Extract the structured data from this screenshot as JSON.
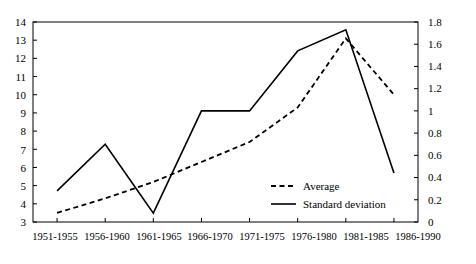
{
  "chart_data": {
    "type": "line",
    "title": "",
    "xlabel": "",
    "ylabel": "",
    "categories": [
      "1951-1955",
      "1956-1960",
      "1961-1965",
      "1966-1970",
      "1971-1975",
      "1976-1980",
      "1981-1985",
      "1986-1990"
    ],
    "axes": {
      "left": {
        "label": "",
        "ylim": [
          3,
          14
        ],
        "ticks": [
          "3",
          "4",
          "5",
          "6",
          "7",
          "8",
          "9",
          "10",
          "11",
          "12",
          "13",
          "14"
        ],
        "tick_values": [
          3,
          4,
          5,
          6,
          7,
          8,
          9,
          10,
          11,
          12,
          13,
          14
        ],
        "series": "Average"
      },
      "right": {
        "label": "",
        "ylim": [
          0,
          1.8
        ],
        "ticks": [
          "0",
          "0.2",
          "0.4",
          "0.6",
          "0.8",
          "1",
          "1.2",
          "1.4",
          "1.6",
          "1.8"
        ],
        "tick_values": [
          0,
          0.2,
          0.4,
          0.6,
          0.8,
          1.0,
          1.2,
          1.4,
          1.6,
          1.8
        ],
        "series": "Standard deviation"
      }
    },
    "grid": false,
    "legend_position": "center-right-inside",
    "series": [
      {
        "name": "Average",
        "axis": "left",
        "style": "dashed",
        "color": "#000000",
        "values": [
          3.5,
          4.3,
          5.2,
          6.3,
          7.4,
          9.3,
          13.1,
          10.0
        ]
      },
      {
        "name": "Standard deviation",
        "axis": "right",
        "style": "solid",
        "color": "#000000",
        "values": [
          0.28,
          0.7,
          0.08,
          1.0,
          1.0,
          1.54,
          1.73,
          0.44
        ]
      }
    ]
  },
  "legend": {
    "items": [
      {
        "label": "Average",
        "style": "dashed"
      },
      {
        "label": "Standard deviation",
        "style": "solid"
      }
    ]
  },
  "y_left": {
    "t0": "3",
    "t1": "4",
    "t2": "5",
    "t3": "6",
    "t4": "7",
    "t5": "8",
    "t6": "9",
    "t7": "10",
    "t8": "11",
    "t9": "12",
    "t10": "13",
    "t11": "14"
  },
  "y_right": {
    "t0": "0",
    "t1": "0.2",
    "t2": "0.4",
    "t3": "0.6",
    "t4": "0.8",
    "t5": "1",
    "t6": "1.2",
    "t7": "1.4",
    "t8": "1.6",
    "t9": "1.8"
  },
  "x_axis": {
    "c0": "1951-1955",
    "c1": "1956-1960",
    "c2": "1961-1965",
    "c3": "1966-1970",
    "c4": "1971-1975",
    "c5": "1976-1980",
    "c6": "1981-1985",
    "c7": "1986-1990"
  }
}
